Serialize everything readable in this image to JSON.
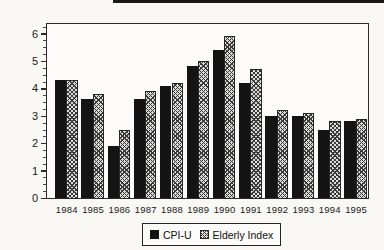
{
  "chart_data": {
    "type": "bar",
    "title": "",
    "xlabel": "",
    "ylabel": "",
    "categories": [
      "1984",
      "1985",
      "1986",
      "1987",
      "1988",
      "1989",
      "1990",
      "1991",
      "1992",
      "1993",
      "1994",
      "1995"
    ],
    "series": [
      {
        "name": "CPI-U",
        "pattern": "solid",
        "color": "#141414",
        "values": [
          4.3,
          3.6,
          1.9,
          3.6,
          4.1,
          4.8,
          5.4,
          4.2,
          3.0,
          3.0,
          2.5,
          2.8
        ]
      },
      {
        "name": "Elderly Index",
        "pattern": "crosshatch",
        "color": "#dcdcda",
        "hatch_color": "#3a3a3a",
        "values": [
          4.3,
          3.8,
          2.5,
          3.9,
          4.2,
          5.0,
          5.9,
          4.7,
          3.2,
          3.1,
          2.8,
          2.9
        ]
      }
    ],
    "ylim": [
      0,
      6
    ],
    "yticks": [
      "0",
      "1",
      "2",
      "3",
      "4",
      "5",
      "6"
    ],
    "minor_tick_step": 0.25,
    "grid": false,
    "legend_position": "bottom-center",
    "plot_border": true
  }
}
